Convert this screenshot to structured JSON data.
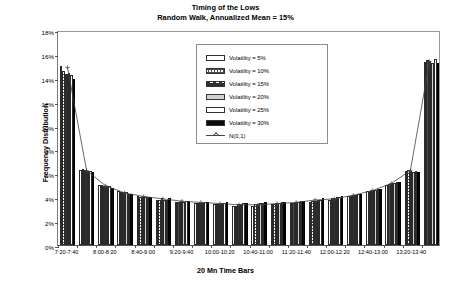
{
  "chart_data": {
    "type": "bar",
    "title": "Timing of the Lows",
    "subtitle": "Random Walk, Annualized Mean = 15%",
    "xlabel": "20 Mn Time Bars",
    "ylabel": "Frequency Distribution",
    "ylim": [
      0,
      18
    ],
    "ytick_labels": [
      "0%",
      "2%",
      "4%",
      "6%",
      "8%",
      "10%",
      "12%",
      "14%",
      "16%",
      "18%"
    ],
    "ytick_values": [
      0,
      2,
      4,
      6,
      8,
      10,
      12,
      14,
      16,
      18
    ],
    "grid": false,
    "legend_position": "inside-top-center",
    "categories": [
      "7:20-7:40",
      "7:40-8:00",
      "8:00-8:20",
      "8:20-8:40",
      "8:40-9:00",
      "9:00-9:20",
      "9:20-9:40",
      "9:40-10:00",
      "10:00-10:20",
      "10:20-10:40",
      "10:40-11:00",
      "11:00-11:20",
      "11:20-11:40",
      "11:40-12:00",
      "12:00-12:20",
      "12:20-12:40",
      "12:40-13:00",
      "13:00-13:20",
      "13:20-13:40",
      "13:40-14:00"
    ],
    "xtick_labels_shown": [
      "7:20-7:40",
      "8:00-8:20",
      "8:40-9:00",
      "9:20-9:40",
      "10:00-10:20",
      "10:40-11:00",
      "11:20-11:40",
      "12:00-12:20",
      "12:40-13:00",
      "13:20-13:40"
    ],
    "series": [
      {
        "name": "Volatility = 5%",
        "values": [
          15.0,
          6.3,
          5.0,
          4.5,
          4.1,
          3.8,
          3.6,
          3.5,
          3.4,
          3.3,
          3.3,
          3.4,
          3.5,
          3.6,
          3.8,
          4.1,
          4.5,
          5.0,
          6.2,
          15.3
        ]
      },
      {
        "name": "Volatility = 10%",
        "values": [
          14.6,
          6.4,
          5.0,
          4.4,
          4.0,
          3.8,
          3.6,
          3.5,
          3.4,
          3.3,
          3.4,
          3.4,
          3.5,
          3.7,
          3.9,
          4.1,
          4.5,
          5.1,
          6.3,
          15.5
        ]
      },
      {
        "name": "Volatility = 15%",
        "values": [
          14.3,
          6.3,
          4.9,
          4.4,
          4.1,
          3.9,
          3.7,
          3.5,
          3.4,
          3.4,
          3.4,
          3.5,
          3.6,
          3.7,
          3.9,
          4.2,
          4.6,
          5.2,
          6.2,
          15.4
        ]
      },
      {
        "name": "Volatility = 20%",
        "values": [
          14.4,
          6.2,
          4.9,
          4.4,
          4.0,
          3.8,
          3.6,
          3.5,
          3.5,
          3.4,
          3.5,
          3.5,
          3.6,
          3.8,
          4.0,
          4.2,
          4.6,
          5.2,
          6.1,
          15.2
        ]
      },
      {
        "name": "Volatility = 25%",
        "values": [
          14.2,
          6.2,
          4.9,
          4.3,
          4.0,
          3.8,
          3.7,
          3.6,
          3.5,
          3.5,
          3.5,
          3.6,
          3.7,
          3.8,
          4.0,
          4.3,
          4.7,
          5.3,
          6.2,
          15.6
        ]
      },
      {
        "name": "Volatility = 30%",
        "values": [
          13.9,
          6.1,
          4.8,
          4.3,
          4.0,
          3.9,
          3.7,
          3.6,
          3.6,
          3.5,
          3.6,
          3.6,
          3.7,
          3.9,
          4.1,
          4.3,
          4.7,
          5.3,
          6.1,
          15.2
        ]
      }
    ],
    "reference_line": {
      "name": "N(0,1)",
      "values": [
        15.0,
        6.3,
        5.0,
        4.4,
        4.1,
        3.9,
        3.7,
        3.6,
        3.5,
        3.4,
        3.4,
        3.5,
        3.6,
        3.8,
        3.9,
        4.2,
        4.6,
        5.2,
        6.3,
        15.5
      ]
    }
  },
  "legend": {
    "items": [
      {
        "label": "Volatility = 5%"
      },
      {
        "label": "Volatility = 10%"
      },
      {
        "label": "Volatility = 15%"
      },
      {
        "label": "Volatility = 20%"
      },
      {
        "label": "Volatility = 25%"
      },
      {
        "label": "Volatility = 30%"
      },
      {
        "label": "N(0,1)"
      }
    ]
  },
  "colors": {
    "axis": "#555555",
    "frame": "#9a9a9a",
    "curve": "#444444",
    "series_dark": "#0a0a0a",
    "series_light": "#d2d2d2"
  }
}
